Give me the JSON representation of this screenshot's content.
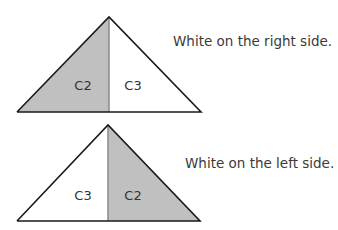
{
  "diagrams": [
    {
      "left_label": "C2",
      "right_label": "C3",
      "left_fill": "#c0c0c0",
      "right_fill": "#ffffff",
      "caption": "White on the right side."
    },
    {
      "left_label": "C3",
      "right_label": "C2",
      "left_fill": "#ffffff",
      "right_fill": "#c0c0c0",
      "caption": "White on the left side."
    }
  ]
}
